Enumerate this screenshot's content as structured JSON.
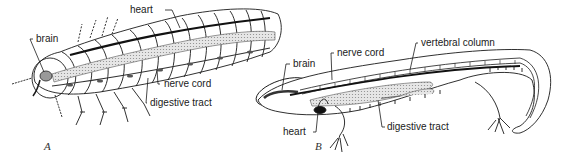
{
  "figure": {
    "panels": [
      {
        "id": "A",
        "label": "A",
        "subject": "arthropod",
        "labels": {
          "brain": "brain",
          "heart": "heart",
          "nerve_cord": "nerve cord",
          "digestive_tract": "digestive tract"
        }
      },
      {
        "id": "B",
        "label": "B",
        "subject": "vertebrate",
        "labels": {
          "brain": "brain",
          "nerve_cord": "nerve cord",
          "vertebral_column": "vertebral column",
          "heart": "heart",
          "digestive_tract": "digestive tract"
        }
      }
    ]
  },
  "colors": {
    "ink": "#1a1a1a",
    "stipple": "#c8c8c8",
    "background": "#ffffff"
  }
}
